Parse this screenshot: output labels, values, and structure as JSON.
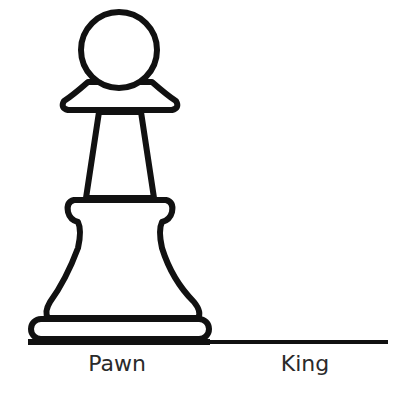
{
  "diagram": {
    "pieces": [
      {
        "name": "Pawn",
        "label_x": 117,
        "label_y": 353
      },
      {
        "name": "King",
        "label_x": 305,
        "label_y": 353
      }
    ],
    "colors": {
      "stroke": "#111111",
      "fill": "#ffffff",
      "text": "#2a2a2a"
    }
  }
}
